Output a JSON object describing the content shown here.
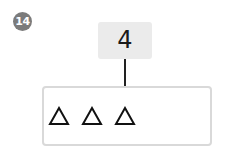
{
  "problem": {
    "number": "14",
    "top_value": "4",
    "shapes": [
      {
        "shape": "triangle",
        "icon": "triangle-outline-icon"
      },
      {
        "shape": "triangle",
        "icon": "triangle-outline-icon"
      },
      {
        "shape": "triangle",
        "icon": "triangle-outline-icon"
      }
    ]
  },
  "colors": {
    "badge": "#7b7b7b",
    "top_box": "#ebebeb",
    "bottom_border": "#d9d9d9",
    "stroke": "#111111"
  }
}
